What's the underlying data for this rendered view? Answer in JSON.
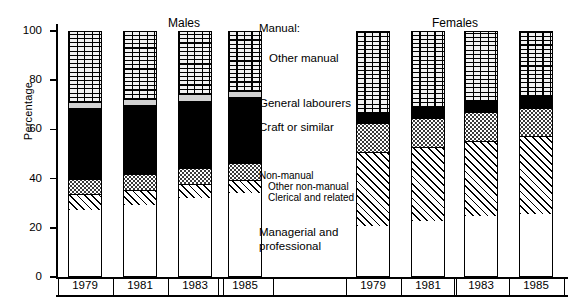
{
  "chart_data": {
    "type": "bar",
    "title": "",
    "subtitle": "",
    "stacked": true,
    "xlabel": "",
    "ylabel": "Percentage",
    "ylim": [
      0,
      100
    ],
    "yticks": [
      0,
      20,
      40,
      60,
      80,
      100
    ],
    "grid": false,
    "legend_position": "inline-center",
    "groups": [
      "Males",
      "Females"
    ],
    "categories": [
      "1979",
      "1981",
      "1983",
      "1985"
    ],
    "series": [
      {
        "name": "Managerial and professional",
        "fill": "white",
        "males": [
          27.0,
          29.0,
          32.0,
          34.0
        ],
        "females": [
          20.5,
          22.5,
          24.5,
          25.5
        ]
      },
      {
        "name": "Clerical and related",
        "fill": "diagonal-hatch",
        "males": [
          6.5,
          6.0,
          5.5,
          5.0
        ],
        "females": [
          30.0,
          30.0,
          30.5,
          31.5
        ]
      },
      {
        "name": "Other non-manual",
        "fill": "dotted",
        "males": [
          6.0,
          6.5,
          6.5,
          7.0
        ],
        "females": [
          12.0,
          12.0,
          12.0,
          11.5
        ]
      },
      {
        "name": "Craft or similar",
        "fill": "black",
        "males": [
          29.0,
          28.0,
          27.5,
          27.0
        ],
        "females": [
          4.0,
          4.5,
          4.5,
          5.0
        ]
      },
      {
        "name": "General labourers",
        "fill": "light-grey",
        "males": [
          2.5,
          2.5,
          2.5,
          2.5
        ],
        "females": [
          0.0,
          0.0,
          0.0,
          0.0
        ]
      },
      {
        "name": "Other manual",
        "fill": "brick",
        "males": [
          29.0,
          28.0,
          26.0,
          24.5
        ],
        "females": [
          33.5,
          31.0,
          28.5,
          26.5
        ]
      }
    ]
  },
  "axis": {
    "ylabel": "Percentage",
    "yticks": [
      "100",
      "80",
      "60",
      "40",
      "20",
      "0"
    ],
    "years_males": [
      "1979",
      "1981",
      "1983",
      "1985"
    ],
    "years_females": [
      "1979",
      "1981",
      "1983",
      "1985"
    ]
  },
  "titles": {
    "males": "Males",
    "females": "Females"
  },
  "annotations": {
    "manual_header": "Manual:",
    "other_manual": "Other manual",
    "general_labourers": "General labourers",
    "craft_or_similar": "Craft or similar",
    "non_manual_header": "Non-manual",
    "other_non_manual": "Other non-manual",
    "clerical_and_related": "Clerical and related",
    "managerial_line1": "Managerial and",
    "managerial_line2": "professional"
  }
}
